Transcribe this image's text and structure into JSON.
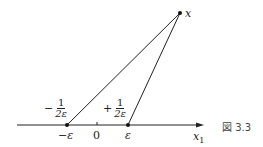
{
  "figure": {
    "caption": "図 3.3",
    "points": {
      "x": {
        "label": "x"
      },
      "minus_eps": {
        "label": "−ε",
        "weight_sign": "−",
        "weight_num": "1",
        "weight_den": "2ε"
      },
      "zero": {
        "label": "0"
      },
      "plus_eps": {
        "label": "ε",
        "weight_sign": "+",
        "weight_num": "1",
        "weight_den": "2ε"
      }
    },
    "axis": {
      "label": "x",
      "label_sub": "1"
    }
  }
}
